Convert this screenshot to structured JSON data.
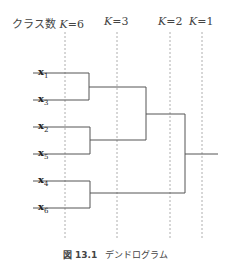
{
  "header": {
    "cluster_prefix": "クラス数",
    "k_labels": [
      {
        "var": "K",
        "eq": "=6",
        "x": 65
      },
      {
        "var": "K",
        "eq": "=3",
        "x": 117
      },
      {
        "var": "K",
        "eq": "=2",
        "x": 170
      },
      {
        "var": "K",
        "eq": "=1",
        "x": 202
      }
    ]
  },
  "leaves": [
    {
      "label": "x",
      "sub": "1",
      "y": 73
    },
    {
      "label": "x",
      "sub": "3",
      "y": 100
    },
    {
      "label": "x",
      "sub": "2",
      "y": 127
    },
    {
      "label": "x",
      "sub": "5",
      "y": 154
    },
    {
      "label": "x",
      "sub": "4",
      "y": 181
    },
    {
      "label": "x",
      "sub": "6",
      "y": 208
    }
  ],
  "caption": {
    "figure_no": "図 13.1",
    "title": "デンドログラム"
  },
  "colors": {
    "line": "#555555",
    "dashed": "#999999"
  }
}
